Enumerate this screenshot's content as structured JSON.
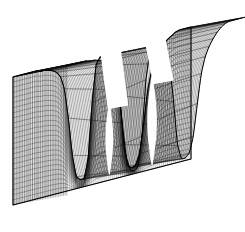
{
  "figure": {
    "title": "",
    "background_color": "#ffffff",
    "line_color": "#101010",
    "silhouette_color": "#000000",
    "width": 245,
    "height": 232
  },
  "chart_data": {
    "type": "line",
    "render_style": "3d-wireframe-surface-hidden-line",
    "title": "",
    "subtitle": "",
    "xlabel": "",
    "ylabel": "",
    "zlabel": "",
    "grid": true,
    "axes_visible": false,
    "tick_labels_visible": false,
    "legend": false,
    "legend_position": "none",
    "projection": {
      "type": "oblique-parallel",
      "azimuth_deg": 42,
      "elevation_deg": 26,
      "depth_dx": 128,
      "depth_dy": -48
    },
    "axis_ranges": {
      "xlim": [
        0,
        1
      ],
      "ylim": [
        0,
        1
      ],
      "zlim": [
        0,
        1
      ]
    },
    "mesh": {
      "u_count": 46,
      "v_count": 34,
      "u_label": "x",
      "v_label": "y"
    },
    "surface_features": [
      {
        "name": "left-plateau",
        "u_start": 0.0,
        "u_end": 0.3,
        "z_level": 0.97
      },
      {
        "name": "cliff-1",
        "u_start": 0.3,
        "u_end": 0.36,
        "z_level": 0.12
      },
      {
        "name": "trough-1",
        "u_start": 0.36,
        "u_end": 0.4,
        "z_level": 0.06
      },
      {
        "name": "mid-plateau",
        "u_start": 0.4,
        "u_end": 0.54,
        "z_level": 0.95
      },
      {
        "name": "cliff-2",
        "u_start": 0.54,
        "u_end": 0.6,
        "z_level": 0.1
      },
      {
        "name": "trough-2",
        "u_start": 0.6,
        "u_end": 0.64,
        "z_level": 0.05
      },
      {
        "name": "right-rise",
        "u_start": 0.64,
        "u_end": 0.78,
        "z_level": 0.8
      },
      {
        "name": "right-plateau",
        "u_start": 0.78,
        "u_end": 1.0,
        "z_level": 1.0
      }
    ],
    "x": [
      0.0,
      0.02,
      0.04,
      0.07,
      0.09,
      0.11,
      0.13,
      0.16,
      0.18,
      0.2,
      0.22,
      0.24,
      0.27,
      0.29,
      0.31,
      0.33,
      0.36,
      0.38,
      0.4,
      0.42,
      0.44,
      0.47,
      0.49,
      0.51,
      0.53,
      0.56,
      0.58,
      0.6,
      0.62,
      0.64,
      0.67,
      0.69,
      0.71,
      0.73,
      0.76,
      0.78,
      0.8,
      0.82,
      0.84,
      0.87,
      0.89,
      0.91,
      0.93,
      0.96,
      0.98,
      1.0
    ],
    "series": [
      {
        "name": "profile-front-edge",
        "values": [
          0.97,
          0.97,
          0.97,
          0.97,
          0.97,
          0.97,
          0.97,
          0.96,
          0.96,
          0.95,
          0.94,
          0.92,
          0.88,
          0.78,
          0.55,
          0.26,
          0.09,
          0.06,
          0.06,
          0.2,
          0.62,
          0.9,
          0.95,
          0.95,
          0.95,
          0.93,
          0.86,
          0.62,
          0.24,
          0.07,
          0.05,
          0.06,
          0.14,
          0.35,
          0.6,
          0.74,
          0.82,
          0.88,
          0.92,
          0.95,
          0.97,
          0.99,
          1.0,
          1.0,
          1.0,
          1.0
        ]
      },
      {
        "name": "profile-back-edge",
        "values": [
          0.98,
          0.98,
          0.98,
          0.98,
          0.98,
          0.98,
          0.97,
          0.97,
          0.96,
          0.95,
          0.93,
          0.9,
          0.84,
          0.7,
          0.44,
          0.18,
          0.07,
          0.05,
          0.07,
          0.3,
          0.72,
          0.93,
          0.96,
          0.96,
          0.95,
          0.91,
          0.8,
          0.5,
          0.16,
          0.05,
          0.05,
          0.08,
          0.2,
          0.44,
          0.66,
          0.78,
          0.85,
          0.9,
          0.94,
          0.97,
          0.99,
          1.0,
          1.0,
          1.0,
          1.0,
          1.0
        ]
      },
      {
        "name": "profile-mid-depth",
        "values": [
          0.975,
          0.975,
          0.975,
          0.975,
          0.975,
          0.975,
          0.97,
          0.965,
          0.96,
          0.95,
          0.935,
          0.91,
          0.86,
          0.74,
          0.5,
          0.22,
          0.08,
          0.055,
          0.065,
          0.25,
          0.67,
          0.915,
          0.955,
          0.955,
          0.95,
          0.92,
          0.83,
          0.56,
          0.2,
          0.06,
          0.05,
          0.07,
          0.17,
          0.395,
          0.63,
          0.76,
          0.835,
          0.89,
          0.93,
          0.96,
          0.98,
          0.995,
          1.0,
          1.0,
          1.0,
          1.0
        ]
      }
    ]
  }
}
